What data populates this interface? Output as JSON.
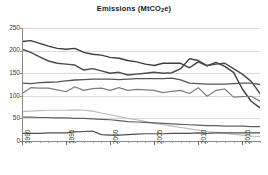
{
  "chart_data": {
    "type": "line",
    "title": "Emissions  (MtCO2e)",
    "title_main": "Emissions  (MtCO",
    "title_sub": "2",
    "title_tail": "e)",
    "xlabel": "",
    "ylabel": "",
    "ylim": [
      0,
      250
    ],
    "xlim": [
      1990,
      2017
    ],
    "grid": true,
    "legend": "none",
    "yticks": [
      0,
      50,
      100,
      150,
      200,
      250
    ],
    "ytick_labels": [
      "0",
      "50",
      "100",
      "150",
      "200",
      "250"
    ],
    "xticks": [
      1990,
      1995,
      2000,
      2005,
      2010,
      2015
    ],
    "xtick_labels": [
      "1990",
      "1995",
      "2000",
      "2005",
      "2010",
      "2015"
    ],
    "x": [
      1990,
      1991,
      1992,
      1993,
      1994,
      1995,
      1996,
      1997,
      1998,
      1999,
      2000,
      2001,
      2002,
      2003,
      2004,
      2005,
      2006,
      2007,
      2008,
      2009,
      2010,
      2011,
      2012,
      2013,
      2014,
      2015,
      2016,
      2017
    ],
    "series": [
      {
        "name": "Energy supply",
        "color": "#3d3d3d",
        "width": 1.4,
        "values": [
          220,
          222,
          216,
          210,
          205,
          203,
          205,
          196,
          192,
          190,
          185,
          183,
          178,
          175,
          170,
          167,
          172,
          172,
          172,
          162,
          175,
          166,
          174,
          165,
          152,
          115,
          88,
          73
        ]
      },
      {
        "name": "Business and industry",
        "color": "#4a4a4a",
        "width": 1.4,
        "values": [
          203,
          196,
          186,
          177,
          172,
          170,
          168,
          157,
          160,
          155,
          150,
          152,
          146,
          148,
          150,
          152,
          150,
          151,
          160,
          182,
          178,
          167,
          170,
          172,
          160,
          148,
          132,
          105
        ]
      },
      {
        "name": "Transport",
        "color": "#555555",
        "width": 1.3,
        "values": [
          128,
          127,
          129,
          130,
          131,
          133,
          135,
          136,
          137,
          137,
          137,
          136,
          137,
          138,
          138,
          138,
          138,
          139,
          135,
          128,
          127,
          126,
          126,
          126,
          127,
          128,
          128,
          125
        ]
      },
      {
        "name": "Residential",
        "color": "#7d7d7d",
        "width": 1.2,
        "values": [
          105,
          118,
          117,
          117,
          113,
          109,
          120,
          112,
          116,
          117,
          112,
          118,
          112,
          114,
          113,
          112,
          107,
          110,
          112,
          105,
          118,
          99,
          112,
          115,
          97,
          98,
          99,
          88
        ]
      },
      {
        "name": "Waste management",
        "color": "#bdbdbd",
        "width": 1.2,
        "values": [
          65,
          66,
          67,
          68,
          68,
          68,
          69,
          68,
          66,
          62,
          58,
          54,
          50,
          47,
          43,
          39,
          36,
          33,
          30,
          27,
          24,
          21,
          19,
          17,
          15,
          13,
          11,
          10
        ]
      },
      {
        "name": "Agriculture",
        "color": "#5f5f5f",
        "width": 1.2,
        "values": [
          53,
          53,
          52,
          52,
          51,
          51,
          50,
          50,
          49,
          48,
          47,
          45,
          43,
          42,
          41,
          40,
          39,
          38,
          37,
          36,
          35,
          34,
          34,
          33,
          33,
          33,
          32,
          32
        ]
      },
      {
        "name": "Public and other",
        "color": "#4f4f4f",
        "width": 1.2,
        "values": [
          17,
          17,
          17,
          18,
          18,
          18,
          20,
          21,
          22,
          14,
          13,
          13,
          14,
          15,
          16,
          16,
          16,
          17,
          17,
          17,
          18,
          17,
          18,
          18,
          18,
          18,
          18,
          18
        ]
      }
    ]
  }
}
